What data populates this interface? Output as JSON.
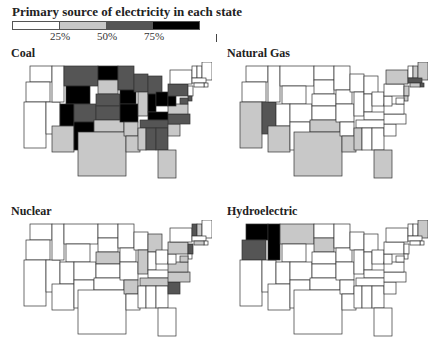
{
  "legend": {
    "title": "Primary source of electricity in each state",
    "ticks": [
      "25%",
      "50%",
      "75%"
    ],
    "colors": [
      "#ffffff",
      "#c8c8c8",
      "#555555",
      "#000000"
    ]
  },
  "chart_data": {
    "type": "choropleth",
    "title": "Primary source of electricity in each state",
    "legend_bins": [
      {
        "range": "0-25%",
        "color": "#ffffff"
      },
      {
        "range": "25-50%",
        "color": "#c8c8c8"
      },
      {
        "range": "50-75%",
        "color": "#555555"
      },
      {
        "range": "75-100%",
        "color": "#000000"
      }
    ],
    "maps": [
      {
        "title": "Coal",
        "states": {
          "WA": 0,
          "OR": 0,
          "CA": 0,
          "NV": 0,
          "ID": 0,
          "MT": 2,
          "WY": 3,
          "UT": 3,
          "CO": 2,
          "AZ": 1,
          "NM": 3,
          "ND": 3,
          "SD": 1,
          "NE": 2,
          "KS": 2,
          "OK": 1,
          "TX": 1,
          "MN": 2,
          "IA": 3,
          "MO": 3,
          "AR": 1,
          "LA": 1,
          "WI": 2,
          "IL": 1,
          "MI": 2,
          "IN": 3,
          "OH": 3,
          "KY": 3,
          "TN": 2,
          "MS": 1,
          "AL": 2,
          "GA": 2,
          "FL": 1,
          "SC": 1,
          "NC": 2,
          "VA": 1,
          "WV": 3,
          "PA": 2,
          "NY": 0,
          "VT": 0,
          "NH": 0,
          "ME": 0,
          "MA": 0,
          "RI": 0,
          "CT": 0,
          "NJ": 0,
          "DE": 2,
          "MD": 2
        }
      },
      {
        "title": "Natural Gas",
        "states": {
          "WA": 0,
          "OR": 0,
          "CA": 1,
          "NV": 2,
          "ID": 0,
          "MT": 0,
          "WY": 0,
          "UT": 0,
          "CO": 0,
          "AZ": 1,
          "NM": 0,
          "ND": 0,
          "SD": 0,
          "NE": 0,
          "KS": 0,
          "OK": 1,
          "TX": 1,
          "MN": 0,
          "IA": 0,
          "MO": 0,
          "AR": 0,
          "LA": 1,
          "WI": 0,
          "IL": 0,
          "MI": 0,
          "IN": 0,
          "OH": 0,
          "KY": 0,
          "TN": 0,
          "MS": 1,
          "AL": 0,
          "GA": 0,
          "FL": 1,
          "SC": 0,
          "NC": 0,
          "VA": 0,
          "WV": 0,
          "PA": 0,
          "NY": 1,
          "VT": 0,
          "NH": 1,
          "ME": 1,
          "MA": 2,
          "RI": 2,
          "CT": 1,
          "NJ": 1,
          "DE": 1,
          "MD": 0
        }
      },
      {
        "title": "Nuclear",
        "states": {
          "WA": 0,
          "OR": 0,
          "CA": 0,
          "NV": 0,
          "ID": 0,
          "MT": 0,
          "WY": 0,
          "UT": 0,
          "CO": 0,
          "AZ": 0,
          "NM": 0,
          "ND": 0,
          "SD": 0,
          "NE": 1,
          "KS": 0,
          "OK": 0,
          "TX": 0,
          "MN": 0,
          "IA": 0,
          "MO": 0,
          "AR": 1,
          "LA": 0,
          "WI": 0,
          "IL": 1,
          "MI": 1,
          "IN": 0,
          "OH": 0,
          "KY": 0,
          "TN": 1,
          "MS": 0,
          "AL": 0,
          "GA": 0,
          "FL": 0,
          "SC": 2,
          "NC": 1,
          "VA": 1,
          "WV": 0,
          "PA": 1,
          "NY": 0,
          "VT": 2,
          "NH": 1,
          "ME": 0,
          "MA": 0,
          "RI": 0,
          "CT": 1,
          "NJ": 2,
          "DE": 0,
          "MD": 1
        }
      },
      {
        "title": "Hydroelectric",
        "states": {
          "WA": 3,
          "OR": 2,
          "CA": 0,
          "NV": 0,
          "ID": 3,
          "MT": 1,
          "WY": 0,
          "UT": 0,
          "CO": 0,
          "AZ": 0,
          "NM": 0,
          "ND": 0,
          "SD": 1,
          "NE": 0,
          "KS": 0,
          "OK": 0,
          "TX": 0,
          "MN": 0,
          "IA": 0,
          "MO": 0,
          "AR": 0,
          "LA": 0,
          "WI": 0,
          "IL": 0,
          "MI": 0,
          "IN": 0,
          "OH": 0,
          "KY": 0,
          "TN": 0,
          "MS": 0,
          "AL": 0,
          "GA": 0,
          "FL": 0,
          "SC": 0,
          "NC": 0,
          "VA": 0,
          "WV": 0,
          "PA": 0,
          "NY": 0,
          "VT": 0,
          "NH": 0,
          "ME": 1,
          "MA": 0,
          "RI": 0,
          "CT": 0,
          "NJ": 0,
          "DE": 0,
          "MD": 0
        }
      }
    ]
  }
}
